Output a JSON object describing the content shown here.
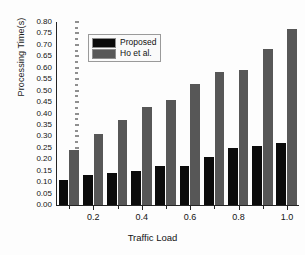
{
  "chart_data": {
    "type": "bar",
    "title": "",
    "xlabel": "Traffic Load",
    "ylabel": "Processing Time(s)",
    "categories": [
      0.1,
      0.2,
      0.3,
      0.4,
      0.5,
      0.6,
      0.7,
      0.8,
      0.9,
      1.0
    ],
    "series": [
      {
        "name": "Proposed",
        "color": "#0b0b0b",
        "values": [
          0.11,
          0.13,
          0.14,
          0.15,
          0.17,
          0.17,
          0.21,
          0.25,
          0.26,
          0.27
        ]
      },
      {
        "name": "Ho et al.",
        "color": "#575757",
        "values": [
          0.24,
          0.31,
          0.37,
          0.43,
          0.46,
          0.53,
          0.58,
          0.59,
          0.68,
          0.77
        ]
      }
    ],
    "ylim": [
      0.0,
      0.8
    ],
    "ytick_step": 0.05,
    "ytick_labels": [
      "0.00",
      "0.05",
      "0.10",
      "0.15",
      "0.20",
      "0.25",
      "0.30",
      "0.35",
      "0.40",
      "0.45",
      "0.50",
      "0.55",
      "0.60",
      "0.65",
      "0.70",
      "0.75",
      "0.80"
    ],
    "xlim": [
      0.05,
      1.05
    ],
    "xtick_labels": [
      "0.2",
      "0.4",
      "0.6",
      "0.8",
      "1.0"
    ],
    "xtick_values": [
      0.2,
      0.4,
      0.6,
      0.8,
      1.0
    ],
    "grid": false,
    "legend_position": "upper-left"
  }
}
